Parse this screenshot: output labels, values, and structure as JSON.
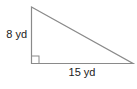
{
  "figure": {
    "shape": "right-triangle",
    "labels": {
      "height": "8 yd",
      "base": "15 yd"
    },
    "right_angle_marker": true,
    "colors": {
      "stroke": "#8a8a8a",
      "text": "#222222",
      "background": "#ffffff"
    }
  }
}
